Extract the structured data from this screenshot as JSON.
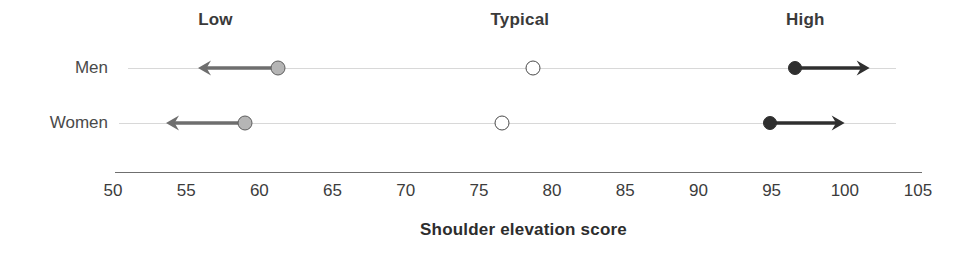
{
  "chart_data": {
    "type": "scatter",
    "title": "",
    "xlabel": "Shoulder elevation score",
    "ylabel": "",
    "xlim": [
      50,
      105
    ],
    "xticks": [
      50,
      55,
      60,
      65,
      70,
      75,
      80,
      85,
      90,
      95,
      100,
      105
    ],
    "xtick_labels": [
      "50",
      "55",
      "60",
      "65",
      "70",
      "75",
      "80",
      "85",
      "90",
      "95",
      "100",
      "105"
    ],
    "grid": false,
    "legend_position": "top",
    "band_labels": [
      {
        "label": "Low",
        "value": 57
      },
      {
        "label": "Typical",
        "value": 77.8
      },
      {
        "label": "High",
        "value": 97.3
      }
    ],
    "categories": [
      "Men",
      "Women"
    ],
    "series": [
      {
        "name": "Low",
        "marker": "gray-filled-circle",
        "values": [
          61.3,
          59.0
        ],
        "arrow_direction": "left",
        "arrow_end": [
          55.8,
          53.6
        ]
      },
      {
        "name": "Typical",
        "marker": "open-circle",
        "values": [
          78.7,
          76.6
        ],
        "arrow_direction": "none",
        "arrow_end": [
          null,
          null
        ]
      },
      {
        "name": "High",
        "marker": "black-filled-circle",
        "values": [
          96.6,
          94.9
        ],
        "arrow_direction": "right",
        "arrow_end": [
          101.7,
          100.0
        ]
      }
    ],
    "rows": [
      {
        "category": "Men",
        "low": 61.3,
        "low_arrow_to": 55.8,
        "typical": 78.7,
        "high": 96.6,
        "high_arrow_to": 101.7,
        "line_from": 51.0,
        "line_to": 103.5
      },
      {
        "category": "Women",
        "low": 59.0,
        "low_arrow_to": 53.6,
        "typical": 76.6,
        "high": 94.9,
        "high_arrow_to": 100.0,
        "line_from": 50.4,
        "line_to": 103.5
      }
    ],
    "colors": {
      "low_marker_fill": "#b5b5b5",
      "low_marker_edge": "#5d5d5d",
      "typical_marker_fill": "#ffffff",
      "typical_marker_edge": "#4a4a4a",
      "high_marker_fill": "#2f2f2f",
      "low_arrow": "#6e6e6e",
      "high_arrow": "#2f2f2f",
      "row_line": "#d8d8d8",
      "axis_line": "#6f6f6f",
      "text": "#3a3a3a",
      "background": "#ffffff"
    }
  }
}
